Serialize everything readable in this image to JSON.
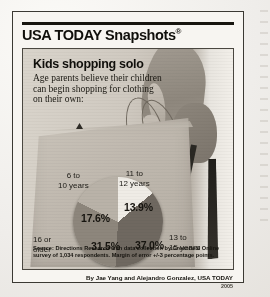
{
  "brand": {
    "name": "USA TODAY Snapshots",
    "registered_mark": "®"
  },
  "headline": "Kids shopping solo",
  "subhead": "Age parents believe their children can begin shopping for clothing on their own:",
  "source_note": "Source: Directions Research with data collection by Greenfield Online survey of 1,034 respondents. Margin of error +/-3 percentage points.",
  "byline": {
    "credit": "By Jae Yang and Alejandro Gonzalez, USA TODAY",
    "year": "2005"
  },
  "labels": {
    "six_to_ten": "6 to\n10 years",
    "eleven_to_twelve": "11 to\n12 years",
    "sixteen_or_older": "16 or\nolder",
    "thirteen_to_fifteen": "13 to\n15 years"
  },
  "values": {
    "six_to_ten": "17.6%",
    "eleven_to_twelve": "13.9%",
    "sixteen_or_older": "31.5%",
    "thirteen_to_fifteen": "37.0%"
  },
  "colors": {
    "slice_13_9": "#efece6",
    "slice_37_0": "#6f6860",
    "slice_31_5": "#8d867c",
    "slice_17_6": "#b9b2a8",
    "frame": "#3b3933",
    "ink": "#100f0b",
    "paper": "#f7f5f1"
  },
  "chart_data": {
    "type": "pie",
    "title": "Kids shopping solo",
    "subtitle": "Age parents believe their children can begin shopping for clothing on their own:",
    "categories": [
      "6 to 10 years",
      "11 to 12 years",
      "13 to 15 years",
      "16 or older"
    ],
    "values": [
      17.6,
      13.9,
      37.0,
      31.5
    ],
    "unit": "percent",
    "data_labels": [
      "17.6%",
      "13.9%",
      "37.0%",
      "31.5%"
    ],
    "colors": [
      "#b9b2a8",
      "#efece6",
      "#6f6860",
      "#8d867c"
    ],
    "legend": "callout labels placed around slices",
    "grid": false,
    "source": "Directions Research with data collection by Greenfield Online survey of 1,034 respondents. Margin of error +/-3 percentage points.",
    "total": 100.0
  }
}
